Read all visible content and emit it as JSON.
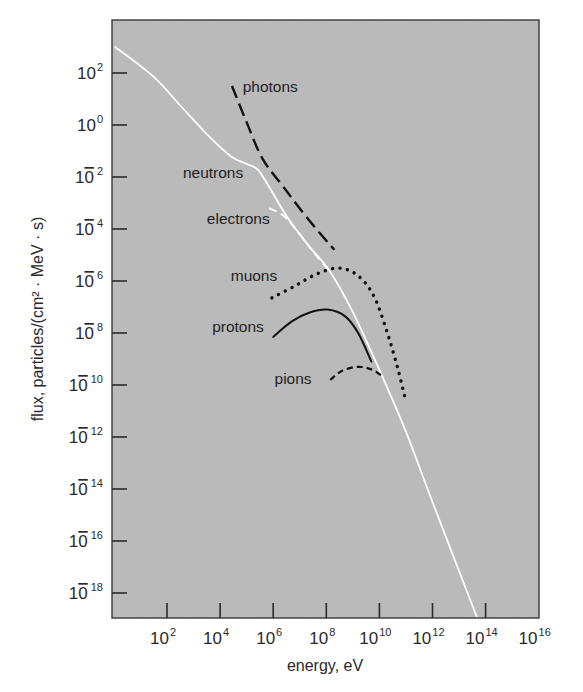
{
  "chart_data": {
    "type": "line",
    "title": "",
    "xlabel": "energy, eV",
    "ylabel": "flux, particles/(cm² · MeV · s)",
    "xscale": "log",
    "yscale": "log",
    "xlim_log10": [
      0,
      16
    ],
    "ylim_log10": [
      -19,
      4
    ],
    "x_ticks": [
      {
        "base": "10",
        "exp": "2",
        "log": 2
      },
      {
        "base": "10",
        "exp": "4",
        "log": 4
      },
      {
        "base": "10",
        "exp": "6",
        "log": 6
      },
      {
        "base": "10",
        "exp": "8",
        "log": 8
      },
      {
        "base": "10",
        "exp": "10",
        "log": 10
      },
      {
        "base": "10",
        "exp": "12",
        "log": 12
      },
      {
        "base": "10",
        "exp": "14",
        "log": 14
      },
      {
        "base": "10",
        "exp": "16",
        "log": 16
      }
    ],
    "y_ticks": [
      {
        "base": "10",
        "exp": "2",
        "neg": false,
        "log": 2
      },
      {
        "base": "10",
        "exp": "0",
        "neg": false,
        "log": 0
      },
      {
        "base": "10",
        "exp": "2",
        "neg": true,
        "log": -2
      },
      {
        "base": "10",
        "exp": "4",
        "neg": true,
        "log": -4
      },
      {
        "base": "10",
        "exp": "6",
        "neg": true,
        "log": -6
      },
      {
        "base": "10",
        "exp": "8",
        "neg": true,
        "log": -8
      },
      {
        "base": "10",
        "exp": "10",
        "neg": true,
        "log": -10
      },
      {
        "base": "10",
        "exp": "12",
        "neg": true,
        "log": -12
      },
      {
        "base": "10",
        "exp": "14",
        "neg": true,
        "log": -14
      },
      {
        "base": "10",
        "exp": "16",
        "neg": true,
        "log": -16
      },
      {
        "base": "10",
        "exp": "18",
        "neg": true,
        "log": -18
      }
    ],
    "grid": false,
    "legend": "inline labels",
    "background": "#bababa",
    "series": [
      {
        "name": "neutrons",
        "style": "solid",
        "color": "#ffffff",
        "log_points": [
          [
            0.05,
            3.0
          ],
          [
            1.5,
            1.85
          ],
          [
            2.5,
            0.75
          ],
          [
            3.5,
            -0.35
          ],
          [
            4.4,
            -1.2
          ],
          [
            5.0,
            -1.5
          ],
          [
            5.4,
            -1.7
          ],
          [
            5.8,
            -2.3
          ],
          [
            6.5,
            -3.5
          ],
          [
            7.3,
            -4.6
          ],
          [
            8.15,
            -5.65
          ],
          [
            9.0,
            -7.2
          ],
          [
            10.1,
            -9.65
          ],
          [
            11.0,
            -11.8
          ],
          [
            12.0,
            -14.5
          ],
          [
            13.7,
            -19.0
          ]
        ],
        "label": {
          "text": "neutrons",
          "log_pos": [
            2.6,
            -1.85
          ]
        }
      },
      {
        "name": "photons",
        "style": "long-dash",
        "color": "#111111",
        "log_points": [
          [
            4.45,
            1.5
          ],
          [
            5.0,
            0.1
          ],
          [
            5.6,
            -1.3
          ],
          [
            6.4,
            -2.4
          ],
          [
            7.3,
            -3.6
          ],
          [
            8.3,
            -4.8
          ]
        ],
        "label": {
          "text": "photons",
          "log_pos": [
            4.85,
            1.45
          ]
        }
      },
      {
        "name": "electrons",
        "style": "dashed",
        "color": "#ffffff",
        "log_points": [
          [
            5.85,
            -3.2
          ],
          [
            6.4,
            -3.5
          ],
          [
            7.0,
            -4.2
          ],
          [
            7.6,
            -5.0
          ],
          [
            8.15,
            -5.65
          ]
        ],
        "label": {
          "text": "electrons",
          "log_pos": [
            3.5,
            -3.6
          ]
        }
      },
      {
        "name": "muons",
        "style": "dotted",
        "color": "#111111",
        "log_points": [
          [
            5.95,
            -6.65
          ],
          [
            6.8,
            -6.2
          ],
          [
            7.6,
            -5.75
          ],
          [
            8.45,
            -5.5
          ],
          [
            9.2,
            -5.8
          ],
          [
            9.8,
            -6.6
          ],
          [
            10.3,
            -8.0
          ],
          [
            10.7,
            -9.4
          ],
          [
            11.0,
            -10.65
          ]
        ],
        "label": {
          "text": "muons",
          "log_pos": [
            4.4,
            -5.8
          ]
        }
      },
      {
        "name": "protons",
        "style": "solid",
        "color": "#111111",
        "log_points": [
          [
            6.0,
            -8.15
          ],
          [
            6.7,
            -7.55
          ],
          [
            7.4,
            -7.2
          ],
          [
            8.05,
            -7.1
          ],
          [
            8.7,
            -7.35
          ],
          [
            9.2,
            -8.0
          ],
          [
            9.7,
            -9.1
          ]
        ],
        "label": {
          "text": "protons",
          "log_pos": [
            3.7,
            -7.75
          ]
        }
      },
      {
        "name": "pions",
        "style": "short-dash",
        "color": "#111111",
        "log_points": [
          [
            8.15,
            -9.8
          ],
          [
            8.6,
            -9.45
          ],
          [
            9.2,
            -9.3
          ],
          [
            9.7,
            -9.4
          ],
          [
            10.1,
            -9.65
          ]
        ],
        "label": {
          "text": "pions",
          "log_pos": [
            6.05,
            -9.75
          ]
        }
      }
    ]
  },
  "figure": {
    "title_hidden": "Particle flux vs energy"
  }
}
